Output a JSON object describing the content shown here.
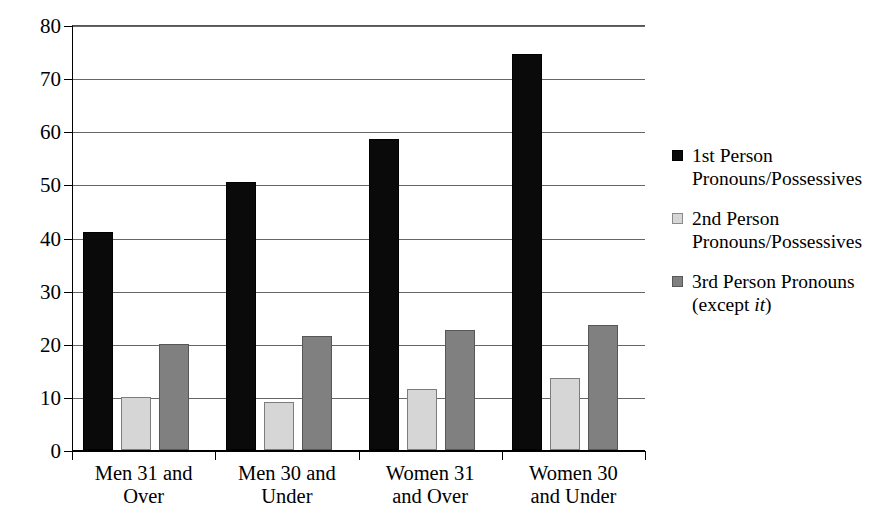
{
  "chart_data": {
    "type": "bar",
    "title": "",
    "subtitle": "",
    "xlabel": "",
    "ylabel": "",
    "ylim": [
      0,
      80
    ],
    "ytick_step": 10,
    "yticks": [
      "0",
      "10",
      "20",
      "30",
      "40",
      "50",
      "60",
      "70",
      "80"
    ],
    "grid": true,
    "legend_position": "right",
    "categories": [
      "Men 31 and\nOver",
      "Men 30 and\nUnder",
      "Women 31\nand Over",
      "Women 30\nand Under"
    ],
    "series": [
      {
        "name": "1st Person\nPronouns/Possessives",
        "color": "#0a0a0a",
        "values": [
          41,
          50.5,
          58.5,
          74.5
        ]
      },
      {
        "name": "2nd Person\nPronouns/Possessives",
        "color": "#d6d6d6",
        "values": [
          10,
          9,
          11.5,
          13.5
        ]
      },
      {
        "name": "3rd Person Pronouns\n(except it)",
        "color": "#808080",
        "values": [
          20,
          21.5,
          22.5,
          23.5
        ]
      }
    ],
    "legend": [
      {
        "line1": "1st Person",
        "line2": "Pronouns/Possessives",
        "italic_word": ""
      },
      {
        "line1": "2nd Person",
        "line2": "Pronouns/Possessives",
        "italic_word": ""
      },
      {
        "line1": "3rd Person Pronouns",
        "line2": "(except ",
        "italic_word": "it",
        "line2_tail": ")"
      }
    ]
  }
}
